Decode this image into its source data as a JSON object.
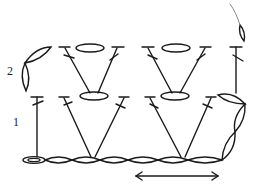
{
  "diagram": {
    "row_labels": [
      {
        "row": 2,
        "text": "2"
      },
      {
        "row": 1,
        "text": "1"
      }
    ],
    "colors": {
      "ink": "#1a1a1a",
      "background": "#ffffff",
      "yarn_tail": "#888888"
    },
    "foundation": {
      "type": "chain",
      "count": 7,
      "start_symbol": "slip-knot"
    },
    "rows": [
      {
        "number": 1,
        "stitches": [
          "dc",
          "V-group (dc, ch1, dc)",
          "V-group (dc, ch1, dc)",
          "turning ch"
        ],
        "turning_chain": "ch 3 up right side"
      },
      {
        "number": 2,
        "stitches": [
          "dc",
          "V-group (dc, ch1, dc)",
          "V-group (dc, ch1, dc)",
          "dc"
        ],
        "turning_chain": "ch 3 on left"
      }
    ],
    "repeat_arrow": {
      "direction": "both",
      "spans": "pattern repeat"
    },
    "yarn_tail": "fasten-off end at top right"
  }
}
